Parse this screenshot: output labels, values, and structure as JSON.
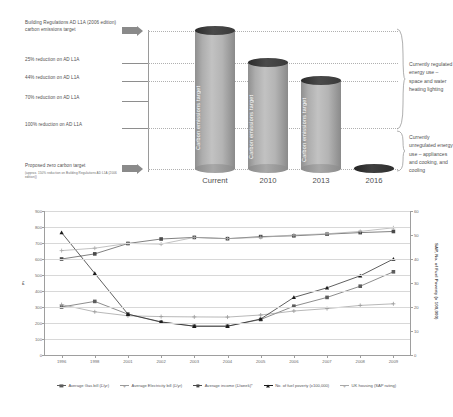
{
  "diagram": {
    "left_labels": [
      {
        "id": "baseline",
        "text": "Building Regulations AD L1A (2006 edition) carbon emissions target",
        "sub": ""
      },
      {
        "id": "r25",
        "text": "25% reduction on AD L1A",
        "sub": ""
      },
      {
        "id": "r44",
        "text": "44% reduction on AD L1A",
        "sub": ""
      },
      {
        "id": "r70",
        "text": "70% reduction on AD L1A",
        "sub": ""
      },
      {
        "id": "r100",
        "text": "100% reduction on AD L1A",
        "sub": ""
      },
      {
        "id": "zero",
        "text": "Proposed zero carbon target",
        "sub": "(approx. 150% reduction on Building Regulations AD L1A (2006 edition))"
      }
    ],
    "cylinders": [
      {
        "caption": "Current",
        "label": "Carbon emissions target"
      },
      {
        "caption": "2010",
        "label": "Carbon emissions target"
      },
      {
        "caption": "2013",
        "label": "Carbon emissions target"
      },
      {
        "caption": "2016",
        "label": ""
      }
    ],
    "notes": [
      {
        "id": "regulated",
        "text": "Currently regulated energy use – space and water heating lighting"
      },
      {
        "id": "unregulated",
        "text": "Currently unregulated energy use – appliances and cooking, and cooling"
      }
    ],
    "colors": {
      "cylinder_body": "#b4b4b4",
      "cylinder_cap": "#333333",
      "arrow": "#8a8a8a",
      "text": "#4f4f4f"
    }
  },
  "chart_data": {
    "type": "line",
    "title": "",
    "xlabel": "",
    "ylabel": "£",
    "ylabel_right": "SAP, No. of Fuel Poverty (x 100,000)",
    "categories": [
      "1996",
      "1998",
      "2001",
      "2002",
      "2003",
      "2004",
      "2005",
      "2006",
      "2007",
      "2008",
      "2009"
    ],
    "ylim": [
      0,
      900
    ],
    "yticks": [
      0,
      100,
      200,
      300,
      400,
      500,
      600,
      700,
      800,
      900
    ],
    "ylim_right": [
      0,
      60
    ],
    "yticks_right": [
      0,
      10,
      20,
      30,
      40,
      50,
      60
    ],
    "grid": true,
    "legend_position": "bottom",
    "series": [
      {
        "name": "Average Gas bill (£/yr)",
        "axis": "left",
        "marker": "square",
        "color": "#5c5c5c",
        "values": [
          300,
          335,
          255,
          205,
          180,
          180,
          222,
          305,
          360,
          430,
          520
        ]
      },
      {
        "name": "Average Electricity bill (£/yr)",
        "axis": "left",
        "marker": "plus",
        "color": "#9a9a9a",
        "values": [
          315,
          270,
          245,
          240,
          238,
          237,
          250,
          275,
          290,
          310,
          320
        ]
      },
      {
        "name": "Average income (£/week)*",
        "axis": "left",
        "marker": "square",
        "color": "#4a4a4a",
        "values": [
          600,
          632,
          697,
          725,
          735,
          727,
          740,
          745,
          755,
          765,
          772
        ]
      },
      {
        "name": "No. of fuel poverty (x100,000)",
        "axis": "right",
        "marker": "triangle",
        "color": "#1b1b1b",
        "values": [
          51,
          34,
          17,
          13.8,
          12,
          12,
          15,
          24,
          28,
          33,
          40
        ]
      },
      {
        "name": "UK housing (SAP rating)",
        "axis": "right",
        "marker": "plus",
        "color": "#a8a8a8",
        "values": [
          43.5,
          44.5,
          46.5,
          46.2,
          49,
          48.5,
          49,
          50,
          50.5,
          51.5,
          53
        ]
      }
    ]
  }
}
